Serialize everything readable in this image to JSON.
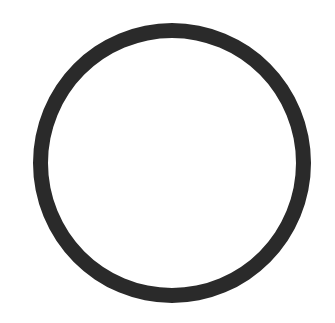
{
  "image": {
    "shape": "ring",
    "stroke_color": "#2a2a2a",
    "background_color": "#ffffff"
  }
}
